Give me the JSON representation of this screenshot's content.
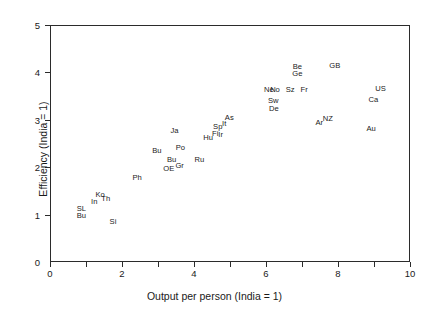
{
  "chart_data": {
    "type": "scatter",
    "title": "",
    "xlabel": "Output per person (India = 1)",
    "ylabel": "Efficiency (India = 1)",
    "xlim": [
      0,
      10
    ],
    "ylim": [
      0,
      5
    ],
    "xticks": [
      0,
      1,
      2,
      3,
      4,
      5,
      6,
      7,
      8,
      9,
      10
    ],
    "xticklabels": [
      "0",
      "",
      "2",
      "",
      "4",
      "",
      "6",
      "",
      "8",
      "",
      "10"
    ],
    "yticks": [
      0,
      1,
      2,
      3,
      4,
      5
    ],
    "yticklabels": [
      "0",
      "1",
      "2",
      "3",
      "4",
      "5"
    ],
    "grid": false,
    "legend": null,
    "marker_style": "text-label",
    "points": [
      {
        "label": "SL",
        "x": 0.87,
        "y": 1.12
      },
      {
        "label": "Bu",
        "x": 0.87,
        "y": 0.97
      },
      {
        "label": "In",
        "x": 1.23,
        "y": 1.26
      },
      {
        "label": "Ko",
        "x": 1.39,
        "y": 1.41
      },
      {
        "label": "Th",
        "x": 1.55,
        "y": 1.33
      },
      {
        "label": "Si",
        "x": 1.75,
        "y": 0.85
      },
      {
        "label": "Ph",
        "x": 2.42,
        "y": 1.78
      },
      {
        "label": "Bu",
        "x": 2.97,
        "y": 2.35
      },
      {
        "label": "OE",
        "x": 3.3,
        "y": 1.97
      },
      {
        "label": "Bu",
        "x": 3.38,
        "y": 2.15
      },
      {
        "label": "Gr",
        "x": 3.6,
        "y": 2.03
      },
      {
        "label": "Po",
        "x": 3.62,
        "y": 2.4
      },
      {
        "label": "Ja",
        "x": 3.46,
        "y": 2.77
      },
      {
        "label": "Ru",
        "x": 4.15,
        "y": 2.15
      },
      {
        "label": "Hu",
        "x": 4.39,
        "y": 2.62
      },
      {
        "label": "Fi",
        "x": 4.59,
        "y": 2.7
      },
      {
        "label": "Ir",
        "x": 4.74,
        "y": 2.68
      },
      {
        "label": "Sp",
        "x": 4.66,
        "y": 2.85
      },
      {
        "label": "It",
        "x": 4.84,
        "y": 2.92
      },
      {
        "label": "As",
        "x": 4.98,
        "y": 3.04
      },
      {
        "label": "Ne",
        "x": 6.08,
        "y": 3.62
      },
      {
        "label": "No",
        "x": 6.25,
        "y": 3.62
      },
      {
        "label": "Sw",
        "x": 6.2,
        "y": 3.4
      },
      {
        "label": "De",
        "x": 6.22,
        "y": 3.23
      },
      {
        "label": "Sz",
        "x": 6.67,
        "y": 3.63
      },
      {
        "label": "Be",
        "x": 6.87,
        "y": 4.11
      },
      {
        "label": "Ge",
        "x": 6.87,
        "y": 3.96
      },
      {
        "label": "Fr",
        "x": 7.06,
        "y": 3.63
      },
      {
        "label": "Ar",
        "x": 7.48,
        "y": 2.94
      },
      {
        "label": "NZ",
        "x": 7.72,
        "y": 3.02
      },
      {
        "label": "GB",
        "x": 7.91,
        "y": 4.13
      },
      {
        "label": "Au",
        "x": 8.92,
        "y": 2.8
      },
      {
        "label": "Ca",
        "x": 8.98,
        "y": 3.41
      },
      {
        "label": "US",
        "x": 9.18,
        "y": 3.64
      }
    ]
  },
  "colors": {
    "axis": "#2b2b2b",
    "text": "#1a1a1a",
    "background": "#ffffff"
  }
}
